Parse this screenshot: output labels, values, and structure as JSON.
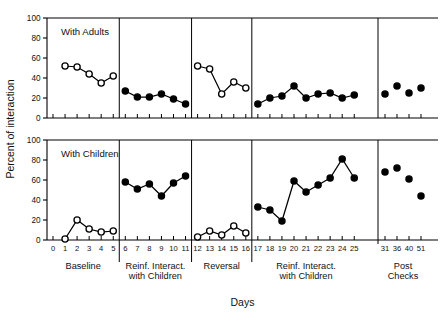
{
  "figure": {
    "ylabel": "Percent of interaction",
    "xlabel": "Days",
    "panels": [
      {
        "name": "With Adults"
      },
      {
        "name": "With Children"
      }
    ],
    "y_ticks": [
      "0",
      "20",
      "40",
      "60",
      "80",
      "100"
    ],
    "x_tick_labels": [
      "0",
      "1",
      "2",
      "3",
      "4",
      "5",
      "6",
      "7",
      "8",
      "9",
      "10",
      "11",
      "12",
      "13",
      "14",
      "15",
      "16",
      "17",
      "18",
      "19",
      "20",
      "21",
      "22",
      "23",
      "24",
      "25",
      "31",
      "36",
      "40",
      "51"
    ],
    "phase_labels": [
      {
        "line1": "Baseline",
        "line2": ""
      },
      {
        "line1": "Reinf. Interact.",
        "line2": "with Children"
      },
      {
        "line1": "Reversal",
        "line2": ""
      },
      {
        "line1": "Reinf. Interact.",
        "line2": "with Children"
      },
      {
        "line1": "Post",
        "line2": "Checks"
      }
    ]
  },
  "chart_data": {
    "type": "line",
    "title": "",
    "xlabel": "Days",
    "ylabel": "Percent of interaction",
    "ylim": [
      0,
      100
    ],
    "xlim": [
      0,
      29
    ],
    "grid": false,
    "legend": "none",
    "marker_styles": {
      "open": "open circle (baseline / reversal phases)",
      "filled": "filled circle (reinforcement / post-check phases)"
    },
    "panels": [
      {
        "name": "With Adults",
        "series": [
          {
            "name": "Baseline",
            "marker": "open",
            "connected": true,
            "x": [
              1,
              2,
              3,
              4,
              5
            ],
            "values": [
              52,
              51,
              44,
              35,
              42
            ]
          },
          {
            "name": "Reinf. Interact. with Children",
            "marker": "filled",
            "connected": true,
            "x": [
              6,
              7,
              8,
              9,
              10,
              11
            ],
            "values": [
              27,
              21,
              21,
              24,
              19,
              14
            ]
          },
          {
            "name": "Reversal",
            "marker": "open",
            "connected": true,
            "x": [
              12,
              13,
              14,
              15,
              16
            ],
            "values": [
              52,
              49,
              24,
              36,
              30
            ]
          },
          {
            "name": "Reinf. Interact. with Children 2",
            "marker": "filled",
            "connected": true,
            "x": [
              17,
              18,
              19,
              20,
              21,
              22,
              23,
              24,
              25
            ],
            "values": [
              14,
              20,
              22,
              32,
              20,
              24,
              25,
              20,
              23
            ]
          },
          {
            "name": "Post Checks",
            "marker": "filled",
            "connected": false,
            "x": [
              31,
              36,
              40,
              51
            ],
            "values": [
              24,
              32,
              25,
              30
            ]
          }
        ]
      },
      {
        "name": "With Children",
        "series": [
          {
            "name": "Baseline",
            "marker": "open",
            "connected": true,
            "x": [
              1,
              2,
              3,
              4,
              5
            ],
            "values": [
              1,
              20,
              11,
              8,
              9
            ]
          },
          {
            "name": "Reinf. Interact. with Children",
            "marker": "filled",
            "connected": true,
            "x": [
              6,
              7,
              8,
              9,
              10,
              11
            ],
            "values": [
              58,
              51,
              56,
              44,
              57,
              64
            ]
          },
          {
            "name": "Reversal",
            "marker": "open",
            "connected": true,
            "x": [
              12,
              13,
              14,
              15,
              16
            ],
            "values": [
              3,
              9,
              5,
              14,
              7
            ]
          },
          {
            "name": "Reinf. Interact. with Children 2",
            "marker": "filled",
            "connected": true,
            "x": [
              17,
              18,
              19,
              20,
              21,
              22,
              23,
              24,
              25
            ],
            "values": [
              33,
              30,
              19,
              59,
              48,
              55,
              62,
              81,
              62
            ]
          },
          {
            "name": "Post Checks",
            "marker": "filled",
            "connected": false,
            "x": [
              31,
              36,
              40,
              51
            ],
            "values": [
              68,
              72,
              61,
              44
            ]
          }
        ]
      }
    ]
  }
}
